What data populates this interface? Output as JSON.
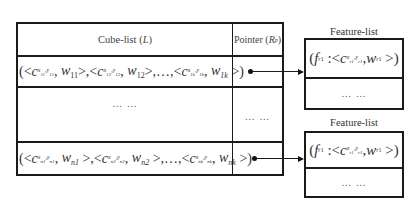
{
  "cube_list_table": {
    "header": {
      "cube_list_label": "Cube-list (L)",
      "pointer_label": "Pointer (Rp)"
    },
    "rows": [
      {
        "formula": "(<c_{x11,y11}, w_{11}>, <c_{x12,y12}, w_{12}>, ..., <c_{x1k,y1k}, w_{1k}>)",
        "pointer": "arrow"
      },
      {
        "formula": "… …",
        "pointer": "… …"
      },
      {
        "formula": "(<c_{xn1,yn1}, w_{n1}>, <c_{xn2,yn2}, w_{n2}>, ..., <c_{xnk,ynk}, w_{nk}>)",
        "pointer": "arrow"
      }
    ]
  },
  "feature_lists": [
    {
      "title": "Feature-list",
      "entry": "(f_{r1} : <c_{xr1,yr1}, w_{r1}>)",
      "more": "… …"
    },
    {
      "title": "Feature-list",
      "entry": "(f_{r1} : <c_{xr1,yr1}, w_{r1}>)",
      "more": "… …"
    }
  ],
  "text": {
    "cube_list": "Cube-list (",
    "L": "L",
    "close": ")",
    "pointer": "Pointer (",
    "R": "R",
    "p": "p",
    "ellipsis": "… …",
    "feature_list": "Feature-list"
  }
}
